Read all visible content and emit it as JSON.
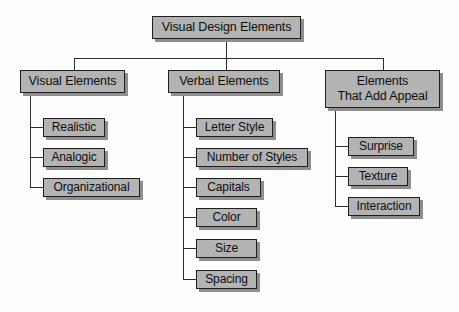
{
  "diagram": {
    "type": "hierarchy-tree",
    "title": "Visual Design Elements",
    "root": {
      "label": "Visual Design Elements"
    },
    "branches": [
      {
        "label": "Visual Elements",
        "children": [
          {
            "label": "Realistic"
          },
          {
            "label": "Analogic"
          },
          {
            "label": "Organizational"
          }
        ]
      },
      {
        "label": "Verbal Elements",
        "children": [
          {
            "label": "Letter Style"
          },
          {
            "label": "Number of Styles"
          },
          {
            "label": "Capitals"
          },
          {
            "label": "Color"
          },
          {
            "label": "Size"
          },
          {
            "label": "Spacing"
          }
        ]
      },
      {
        "label_line1": "Elements",
        "label_line2": "That Add Appeal",
        "children": [
          {
            "label": "Surprise"
          },
          {
            "label": "Texture"
          },
          {
            "label": "Interaction"
          }
        ]
      }
    ],
    "colors": {
      "box_fill": "#b3b3b3",
      "box_border": "#1e1e1e",
      "box_shadow": "#8e8e8e",
      "line": "#2e2e2e",
      "background": "#fdfdfd",
      "text": "#0d0d0d"
    }
  }
}
